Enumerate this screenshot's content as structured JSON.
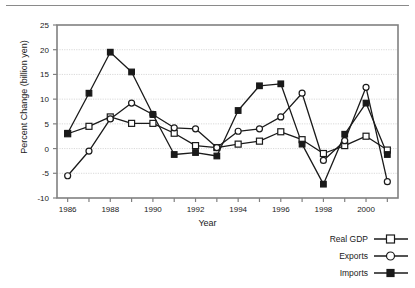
{
  "chart_data": {
    "type": "line",
    "title": "",
    "xlabel": "Year",
    "ylabel": "Percent Change (billion yen)",
    "xlim": [
      1985.5,
      2001.5
    ],
    "ylim": [
      -10,
      25
    ],
    "ytick_step": 5,
    "yticks": [
      "25",
      "20",
      "15",
      "10",
      "5",
      "0",
      "-5",
      "-10"
    ],
    "ytick_values": [
      25,
      20,
      15,
      10,
      5,
      0,
      -5,
      -10
    ],
    "xticks_labeled": [
      "1986",
      "1988",
      "1990",
      "1992",
      "1994",
      "1996",
      "1998",
      "2000"
    ],
    "xtick_values_labeled": [
      1986,
      1988,
      1990,
      1992,
      1994,
      1996,
      1998,
      2000
    ],
    "x": [
      1986,
      1987,
      1988,
      1989,
      1990,
      1991,
      1992,
      1993,
      1994,
      1995,
      1996,
      1997,
      1998,
      1999,
      2000,
      2001
    ],
    "grid": true,
    "grid_axis": "y",
    "legend_position": "bottom-right",
    "series": [
      {
        "name": "Real GDP",
        "marker": "open-square",
        "values": [
          3.0,
          4.5,
          6.4,
          5.1,
          5.1,
          3.1,
          0.6,
          0.2,
          0.9,
          1.5,
          3.4,
          1.8,
          -1.0,
          0.6,
          2.5,
          -0.3
        ]
      },
      {
        "name": "Exports",
        "marker": "open-circle",
        "values": [
          -5.5,
          -0.5,
          6.0,
          9.2,
          6.9,
          4.2,
          4.0,
          0.2,
          3.5,
          4.0,
          6.4,
          11.2,
          -2.4,
          1.6,
          12.4,
          -6.7
        ]
      },
      {
        "name": "Imports",
        "marker": "filled-square",
        "values": [
          3.1,
          11.2,
          19.5,
          15.5,
          6.9,
          -1.2,
          -0.8,
          -1.5,
          7.7,
          12.7,
          13.1,
          0.9,
          -7.2,
          2.9,
          9.2,
          -1.2
        ]
      }
    ]
  },
  "legend": {
    "items": [
      {
        "label": "Real GDP",
        "marker": "open-square"
      },
      {
        "label": "Exports",
        "marker": "open-circle"
      },
      {
        "label": "Imports",
        "marker": "filled-square"
      }
    ]
  },
  "colors": {
    "line": "#1a1a1a",
    "grid": "#cfcfcf",
    "frame": "#808080",
    "rule": "#8a8a8a",
    "marker_fill_open": "#ffffff",
    "marker_fill_closed": "#1a1a1a"
  }
}
